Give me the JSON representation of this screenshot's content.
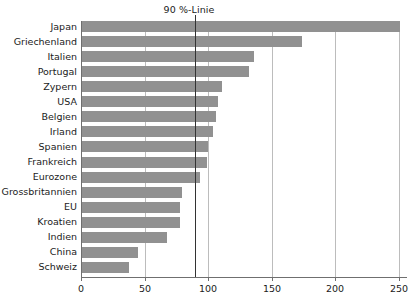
{
  "chart_data": {
    "type": "bar",
    "orientation": "horizontal",
    "title": "90 %-Linie",
    "xlabel": "",
    "ylabel": "",
    "xlim": [
      0,
      257
    ],
    "xticks": [
      0,
      50,
      100,
      150,
      200,
      250
    ],
    "xtick_labels": [
      "0",
      "50",
      "100",
      "150",
      "200",
      "250"
    ],
    "grid": "vertical",
    "legend": "none",
    "annotations": [
      {
        "label": "90 %-Linie",
        "value": 90,
        "type": "vertical-reference-line"
      }
    ],
    "categories": [
      "Japan",
      "Griechenland",
      "Italien",
      "Portugal",
      "Zypern",
      "USA",
      "Belgien",
      "Irland",
      "Spanien",
      "Frankreich",
      "Eurozone",
      "Grossbritannien",
      "EU",
      "Kroatien",
      "Indien",
      "China",
      "Schweiz"
    ],
    "values": [
      250,
      173,
      135,
      131,
      110,
      107,
      105,
      103,
      99,
      98,
      93,
      79,
      77,
      77,
      67,
      44,
      37
    ],
    "series": [
      {
        "name": "Staatsverschuldung in % des BIP",
        "values": [
          250,
          173,
          135,
          131,
          110,
          107,
          105,
          103,
          99,
          98,
          93,
          79,
          77,
          77,
          67,
          44,
          37
        ]
      }
    ],
    "bar_color": "#919191",
    "reference_line_color": "#333333",
    "gridline_color": "#bcbcbc",
    "axis_color": "#6f6f6f"
  },
  "footer": {
    "source": ""
  }
}
